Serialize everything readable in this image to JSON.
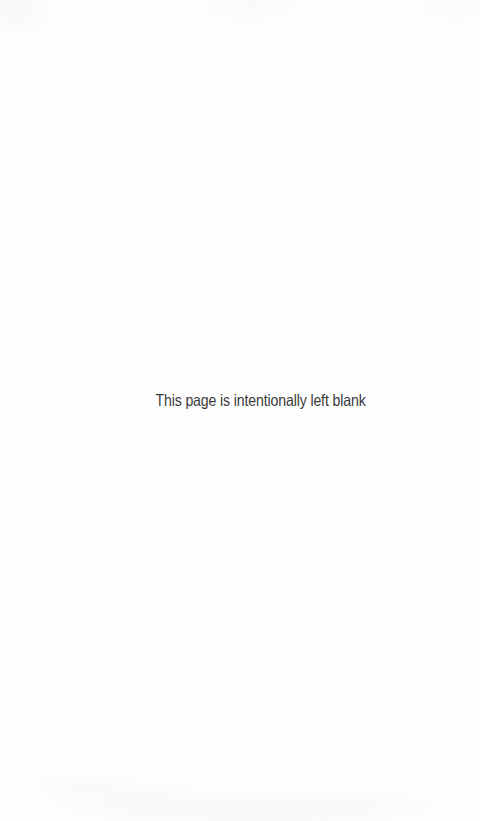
{
  "page": {
    "width": 480,
    "height": 821,
    "background_color": "#fefefe",
    "notice_text": "This page is intentionally left blank",
    "notice_color": "#3a3a3a"
  }
}
